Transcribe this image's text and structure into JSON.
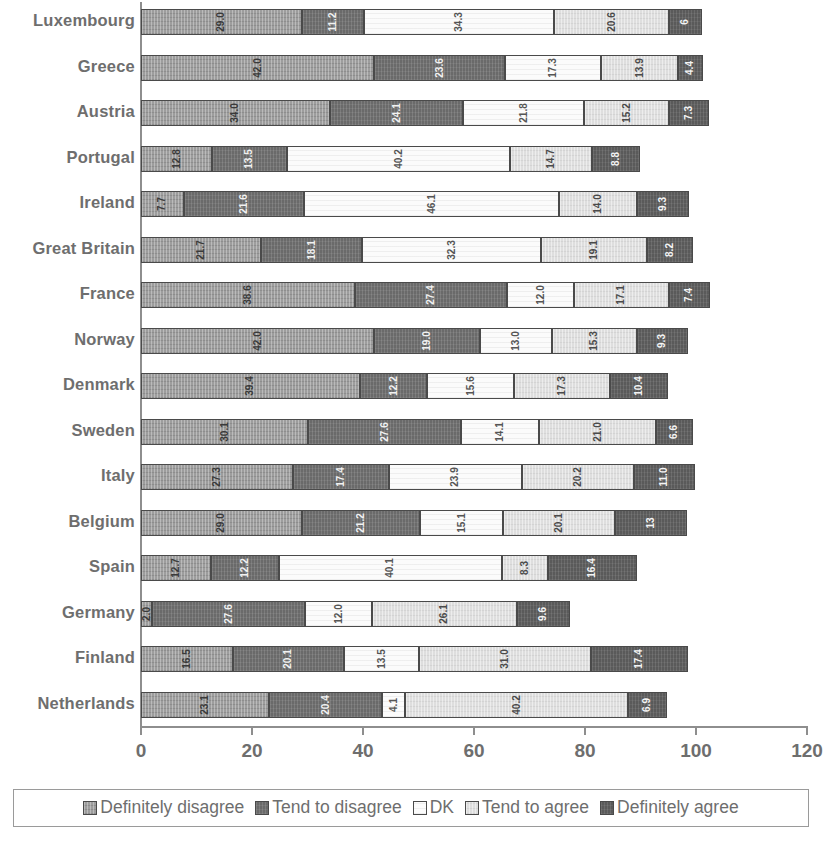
{
  "chart_data": {
    "type": "bar",
    "subtype": "stacked-horizontal-100",
    "title": "",
    "xlabel": "",
    "ylabel": "",
    "xlim": [
      0,
      120
    ],
    "xticks": [
      0,
      20,
      40,
      60,
      80,
      100,
      120
    ],
    "grid": false,
    "legend_position": "bottom",
    "categories": [
      "Luxembourg",
      "Greece",
      "Austria",
      "Portugal",
      "Ireland",
      "Great Britain",
      "France",
      "Norway",
      "Denmark",
      "Sweden",
      "Italy",
      "Belgium",
      "Spain",
      "Germany",
      "Finland",
      "Netherlands"
    ],
    "series": [
      {
        "name": "Definitely disagree",
        "color": "#9d9d9d",
        "values": [
          29.0,
          42.0,
          34.0,
          12.8,
          7.7,
          21.7,
          38.6,
          42.0,
          39.4,
          30.1,
          27.3,
          29.0,
          12.7,
          2.0,
          16.5,
          23.1
        ]
      },
      {
        "name": "Tend to disagree",
        "color": "#6a6a6a",
        "values": [
          11.2,
          23.6,
          24.1,
          13.5,
          21.6,
          18.1,
          27.4,
          19.0,
          12.2,
          27.6,
          17.4,
          21.2,
          12.2,
          27.6,
          20.1,
          20.4
        ]
      },
      {
        "name": "DK",
        "color": "#fbfbfb",
        "values": [
          34.3,
          17.3,
          21.8,
          40.2,
          46.1,
          32.3,
          12.0,
          13.0,
          15.6,
          14.1,
          23.9,
          15.1,
          40.1,
          12.0,
          13.5,
          4.1
        ]
      },
      {
        "name": "Tend to agree",
        "color": "#dedede",
        "values": [
          20.6,
          13.9,
          15.2,
          14.7,
          14.0,
          19.1,
          17.1,
          15.3,
          17.3,
          21.0,
          20.2,
          20.1,
          8.3,
          26.1,
          31.0,
          40.2
        ]
      },
      {
        "name": "Definitely agree",
        "color": "#5a5a5a",
        "values": [
          6.0,
          4.4,
          7.3,
          8.8,
          9.3,
          8.2,
          7.4,
          9.3,
          10.4,
          6.6,
          11.0,
          13.0,
          16.0,
          9.6,
          17.4,
          6.9
        ]
      }
    ],
    "bar_labels": [
      [
        "29.0",
        "11.2",
        "34.3",
        "20.6",
        "6"
      ],
      [
        "42.0",
        "23.6",
        "17.3",
        "13.9",
        "4.4"
      ],
      [
        "34.0",
        "24.1",
        "21.8",
        "15.2",
        "7.3"
      ],
      [
        "12.8",
        "13.5",
        "40.2",
        "14.7",
        "8.8"
      ],
      [
        "7.7",
        "21.6",
        "46.1",
        "14.0",
        "9.3"
      ],
      [
        "21.7",
        "18.1",
        "32.3",
        "19.1",
        "8.2"
      ],
      [
        "38.6",
        "27.4",
        "12.0",
        "17.1",
        "7.4"
      ],
      [
        "42.0",
        "19.0",
        "13.0",
        "15.3",
        "9.3"
      ],
      [
        "39.4",
        "12.2",
        "15.6",
        "17.3",
        "10.4"
      ],
      [
        "30.1",
        "27.6",
        "14.1",
        "21.0",
        "6.6"
      ],
      [
        "27.3",
        "17.4",
        "23.9",
        "20.2",
        "11.0"
      ],
      [
        "29.0",
        "21.2",
        "15.1",
        "20.1",
        "13"
      ],
      [
        "12.7",
        "12.2",
        "40.1",
        "8.3",
        "16.4"
      ],
      [
        "2.0",
        "27.6",
        "12.0",
        "26.1",
        "9.6"
      ],
      [
        "16.5",
        "20.1",
        "13.5",
        "31.0",
        "17.4"
      ],
      [
        "23.1",
        "20.4",
        "4.1",
        "40.2",
        "6.9"
      ]
    ]
  },
  "legend": {
    "items": [
      {
        "label": "Definitely disagree",
        "color": "#9d9d9d"
      },
      {
        "label": "Tend to disagree",
        "color": "#6a6a6a"
      },
      {
        "label": "DK",
        "color": "#fbfbfb"
      },
      {
        "label": "Tend to agree",
        "color": "#dedede"
      },
      {
        "label": "Definitely agree",
        "color": "#5a5a5a"
      }
    ]
  },
  "axis": {
    "x_tick_labels": [
      "0",
      "20",
      "40",
      "60",
      "80",
      "100",
      "120"
    ]
  }
}
